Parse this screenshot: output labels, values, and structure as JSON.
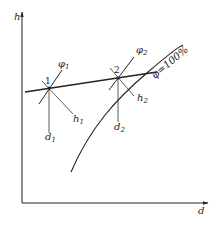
{
  "diagram": {
    "type": "h-d psychrometric chart schematic",
    "axes": {
      "y_label": "h",
      "x_label": "d"
    },
    "states": [
      {
        "id": "1",
        "label": "1",
        "phi": "φ",
        "phi_sub": "1",
        "h": "h",
        "h_sub": "1",
        "d": "d",
        "d_sub": "1"
      },
      {
        "id": "2",
        "label": "2",
        "phi": "φ",
        "phi_sub": "2",
        "h": "h",
        "h_sub": "2",
        "d": "d",
        "d_sub": "2"
      }
    ],
    "saturation_curve": {
      "label": "φ=100%"
    },
    "colors": {
      "line": "#222222",
      "background": "#ffffff"
    }
  }
}
